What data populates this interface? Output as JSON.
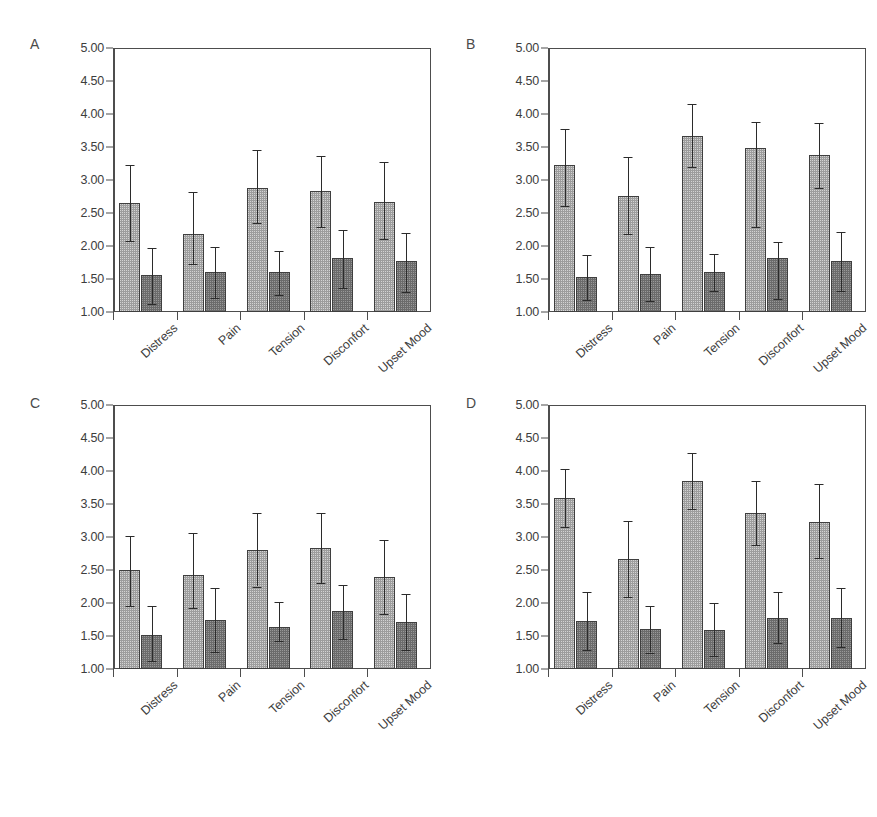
{
  "figure": {
    "background": "#ffffff",
    "panel_letters": [
      "A",
      "B",
      "C",
      "D"
    ],
    "series_colors": {
      "light": "#9d9d9d",
      "dark": "#6b6b6b"
    },
    "axis_color": "#4d4d4d"
  },
  "chart_data": [
    {
      "type": "bar",
      "panel": "A",
      "title": "",
      "xlabel": "",
      "ylabel": "",
      "ylim": [
        1.0,
        5.0
      ],
      "yticks": [
        1.0,
        1.5,
        2.0,
        2.5,
        3.0,
        3.5,
        4.0,
        4.5,
        5.0
      ],
      "ytick_labels": [
        "1.00",
        "1.50",
        "2.00",
        "2.50",
        "3.00",
        "3.50",
        "4.00",
        "4.50",
        "5.00"
      ],
      "grid": false,
      "legend": "none",
      "categories": [
        "Distress",
        "Pain",
        "Tension",
        "Disconfort",
        "Upset Mood"
      ],
      "series": [
        {
          "name": "light",
          "values": [
            2.65,
            2.18,
            2.88,
            2.83,
            2.67
          ],
          "err_low": [
            2.08,
            1.73,
            2.35,
            2.29,
            2.1
          ],
          "err_high": [
            3.22,
            2.82,
            3.45,
            3.37,
            3.27
          ]
        },
        {
          "name": "dark",
          "values": [
            1.56,
            1.61,
            1.61,
            1.82,
            1.77
          ],
          "err_low": [
            1.12,
            1.21,
            1.26,
            1.37,
            1.31
          ],
          "err_high": [
            1.97,
            1.99,
            1.93,
            2.25,
            2.2
          ]
        }
      ]
    },
    {
      "type": "bar",
      "panel": "B",
      "title": "",
      "xlabel": "",
      "ylabel": "",
      "ylim": [
        1.0,
        5.0
      ],
      "yticks": [
        1.0,
        1.5,
        2.0,
        2.5,
        3.0,
        3.5,
        4.0,
        4.5,
        5.0
      ],
      "ytick_labels": [
        "1.00",
        "1.50",
        "2.00",
        "2.50",
        "3.00",
        "3.50",
        "4.00",
        "4.50",
        "5.00"
      ],
      "grid": false,
      "legend": "none",
      "categories": [
        "Distress",
        "Pain",
        "Tension",
        "Disconfort",
        "Upset Mood"
      ],
      "series": [
        {
          "name": "light",
          "values": [
            3.22,
            2.76,
            3.67,
            3.49,
            3.38
          ],
          "err_low": [
            2.61,
            2.18,
            3.19,
            2.29,
            2.88
          ],
          "err_high": [
            3.78,
            3.35,
            4.15,
            3.88,
            3.86
          ]
        },
        {
          "name": "dark",
          "values": [
            1.53,
            1.57,
            1.6,
            1.82,
            1.77
          ],
          "err_low": [
            1.18,
            1.16,
            1.32,
            1.19,
            1.32
          ],
          "err_high": [
            1.86,
            1.99,
            1.88,
            2.06,
            2.21
          ]
        }
      ]
    },
    {
      "type": "bar",
      "panel": "C",
      "title": "",
      "xlabel": "",
      "ylabel": "",
      "ylim": [
        1.0,
        5.0
      ],
      "yticks": [
        1.0,
        1.5,
        2.0,
        2.5,
        3.0,
        3.5,
        4.0,
        4.5,
        5.0
      ],
      "ytick_labels": [
        "1.00",
        "1.50",
        "2.00",
        "2.50",
        "3.00",
        "3.50",
        "4.00",
        "4.50",
        "5.00"
      ],
      "grid": false,
      "legend": "none",
      "categories": [
        "Distress",
        "Pain",
        "Tension",
        "Disconfort",
        "Upset Mood"
      ],
      "series": [
        {
          "name": "light",
          "values": [
            2.5,
            2.42,
            2.8,
            2.84,
            2.39
          ],
          "err_low": [
            1.96,
            1.92,
            2.25,
            2.31,
            1.83
          ],
          "err_high": [
            3.02,
            3.06,
            3.36,
            3.37,
            2.95
          ]
        },
        {
          "name": "dark",
          "values": [
            1.52,
            1.75,
            1.63,
            1.88,
            1.71
          ],
          "err_low": [
            1.12,
            1.26,
            1.42,
            1.46,
            1.29
          ],
          "err_high": [
            1.95,
            2.23,
            2.01,
            2.28,
            2.14
          ]
        }
      ]
    },
    {
      "type": "bar",
      "panel": "D",
      "title": "",
      "xlabel": "",
      "ylabel": "",
      "ylim": [
        1.0,
        5.0
      ],
      "yticks": [
        1.0,
        1.5,
        2.0,
        2.5,
        3.0,
        3.5,
        4.0,
        4.5,
        5.0
      ],
      "ytick_labels": [
        "1.00",
        "1.50",
        "2.00",
        "2.50",
        "3.00",
        "3.50",
        "4.00",
        "4.50",
        "5.00"
      ],
      "grid": false,
      "legend": "none",
      "categories": [
        "Distress",
        "Pain",
        "Tension",
        "Disconfort",
        "Upset Mood"
      ],
      "series": [
        {
          "name": "light",
          "values": [
            3.59,
            2.66,
            3.85,
            3.37,
            3.23
          ],
          "err_low": [
            3.15,
            2.09,
            3.42,
            2.88,
            2.68
          ],
          "err_high": [
            4.03,
            3.25,
            4.28,
            3.85,
            3.8
          ]
        },
        {
          "name": "dark",
          "values": [
            1.72,
            1.6,
            1.59,
            1.78,
            1.78
          ],
          "err_low": [
            1.29,
            1.25,
            1.19,
            1.4,
            1.33
          ],
          "err_high": [
            2.16,
            1.95,
            2.0,
            2.16,
            2.23
          ]
        }
      ]
    }
  ]
}
